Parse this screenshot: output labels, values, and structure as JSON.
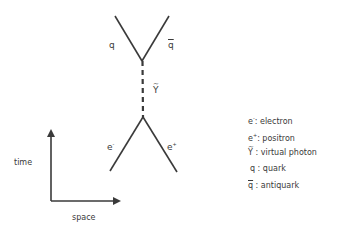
{
  "diagram": {
    "type": "feynman-diagram",
    "title": "",
    "colors": {
      "line": "#3a3a3a",
      "text": "#3a3a3a",
      "background": "#ffffff"
    },
    "particles": {
      "quark_label": "q",
      "antiquark_label": "q",
      "photon_label": "Y",
      "electron_label": "e",
      "electron_sup": "-",
      "positron_label": "e",
      "positron_sup": "+"
    },
    "axes": {
      "time_label": "time",
      "space_label": "space"
    },
    "legend": [
      {
        "symbol": "e",
        "sup": "-",
        "text": ": electron"
      },
      {
        "symbol": "e",
        "sup": "+",
        "text": ": positron"
      },
      {
        "symbol": "Y",
        "sup": "",
        "text": " : virtual photon"
      },
      {
        "symbol": "q",
        "sup": "",
        "text": " :  quark"
      },
      {
        "symbol": "q",
        "sup": "",
        "text": "  : antiquark"
      }
    ]
  }
}
